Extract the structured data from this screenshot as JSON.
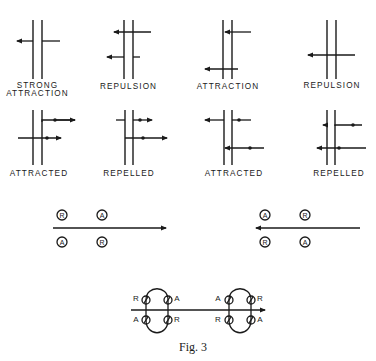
{
  "figure": {
    "caption": "Fig. 3",
    "colors": {
      "ink": "#1a1a1a",
      "background": "#ffffff"
    }
  },
  "top_row": [
    {
      "label_line1": "STRONG",
      "label_line2": "ATTRACTION"
    },
    {
      "label_line1": "REPULSION",
      "label_line2": ""
    },
    {
      "label_line1": "ATTRACTION",
      "label_line2": ""
    },
    {
      "label_line1": "REPULSION",
      "label_line2": ""
    }
  ],
  "second_row": [
    {
      "label": "ATTRACTED"
    },
    {
      "label": "REPELLED"
    },
    {
      "label": "ATTRACTED"
    },
    {
      "label": "REPELLED"
    }
  ],
  "direction_diagrams": {
    "left": {
      "arrow_direction": "right",
      "above": [
        "R",
        "A"
      ],
      "below": [
        "A",
        "R"
      ]
    },
    "right": {
      "arrow_direction": "left",
      "above": [
        "A",
        "R"
      ],
      "below": [
        "R",
        "A"
      ]
    }
  },
  "loop_diagram": {
    "left_loop": {
      "top_left": "R",
      "top_right": "A",
      "bottom_left": "A",
      "bottom_right": "R"
    },
    "right_loop": {
      "top_left": "A",
      "top_right": "R",
      "bottom_left": "R",
      "bottom_right": "A"
    }
  }
}
